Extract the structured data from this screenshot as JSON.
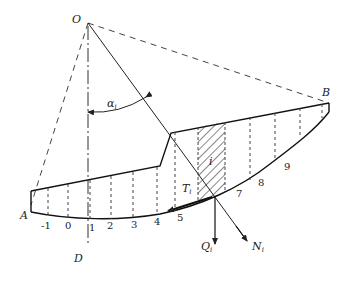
{
  "diagram": {
    "points": {
      "O": {
        "label": "O",
        "x": 88,
        "y": 23
      },
      "A": {
        "label": "A",
        "x": 31,
        "y": 211
      },
      "B": {
        "label": "B",
        "x": 329,
        "y": 103
      },
      "D": {
        "label": "D",
        "x": 88,
        "y": 265
      }
    },
    "angle_label": {
      "text": "α",
      "sub": "i"
    },
    "slice_label": "i",
    "forces": {
      "T": {
        "text": "T",
        "sub": "i"
      },
      "Q": {
        "text": "Q",
        "sub": "i"
      },
      "N": {
        "text": "N",
        "sub": "i"
      }
    },
    "slice_numbers": [
      "-1",
      "0",
      "1",
      "2",
      "3",
      "4",
      "5",
      "7",
      "8",
      "9"
    ],
    "colors": {
      "line": "#222222",
      "dashed": "#444444",
      "background": "#ffffff"
    }
  }
}
